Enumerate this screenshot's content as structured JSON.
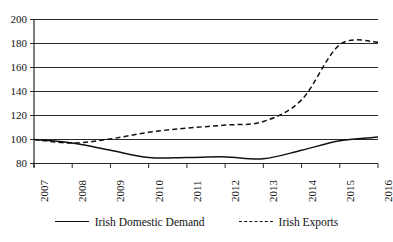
{
  "chart_data": {
    "type": "line",
    "title": "",
    "subtitle": "",
    "xlabel": "",
    "ylabel": "",
    "categories": [
      "2007",
      "2008",
      "2009",
      "2010",
      "2011",
      "2012",
      "2013",
      "2014",
      "2015",
      "2016"
    ],
    "x": [
      2007,
      2008,
      2009,
      2010,
      2011,
      2012,
      2013,
      2014,
      2015,
      2016
    ],
    "ylim": [
      80,
      200
    ],
    "yticks": [
      80,
      100,
      120,
      140,
      160,
      180,
      200
    ],
    "ytick_labels": [
      "80",
      "100",
      "120",
      "140",
      "160",
      "180",
      "200"
    ],
    "grid": "horizontal",
    "legend_position": "bottom",
    "series": [
      {
        "name": "Irish Domestic Demand",
        "style": "solid",
        "color": "#111111",
        "values": [
          100,
          97,
          91,
          85,
          85,
          85.5,
          84,
          91,
          99,
          102
        ]
      },
      {
        "name": "Irish Exports",
        "style": "dashed",
        "color": "#111111",
        "values": [
          100,
          97,
          100.5,
          106,
          109.5,
          112,
          115,
          133,
          179,
          181
        ]
      }
    ],
    "annotations": []
  },
  "legend": {
    "entries": [
      {
        "label": "Irish Domestic Demand",
        "style": "solid"
      },
      {
        "label": "Irish Exports",
        "style": "dashed"
      }
    ]
  },
  "axes": {
    "y_tick_labels": [
      "200",
      "180",
      "160",
      "140",
      "120",
      "100",
      "80"
    ],
    "x_tick_labels": [
      "2007",
      "2008",
      "2009",
      "2010",
      "2011",
      "2012",
      "2013",
      "2014",
      "2015",
      "2016"
    ]
  }
}
